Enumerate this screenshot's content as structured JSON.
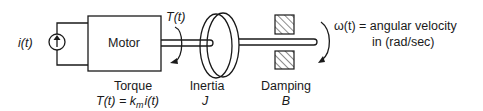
{
  "diagram": {
    "type": "mechanical-system-schematic",
    "current_source": {
      "label": "i(t)"
    },
    "motor": {
      "label": "Motor"
    },
    "torque": {
      "title": "Torque",
      "symbol": "T(t)",
      "equation_left": "T(t) = k",
      "equation_sub": "m",
      "equation_right": "i(t)"
    },
    "inertia": {
      "title": "Inertia",
      "symbol": "J"
    },
    "damping": {
      "title": "Damping",
      "symbol": "B"
    },
    "angular_velocity": {
      "line1": "ω(t) = angular velocity",
      "line2": "in (rad/sec)"
    },
    "colors": {
      "ink": "#1a1a1a",
      "background": "#ffffff"
    }
  }
}
